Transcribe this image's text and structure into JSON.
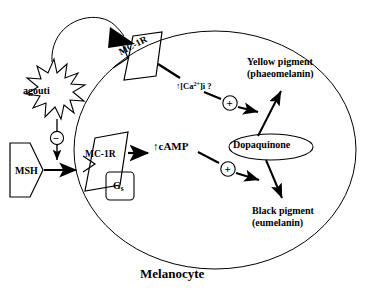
{
  "figure": {
    "caption": "Melanocyte",
    "cell_name": "Melanocyte"
  },
  "nodes": {
    "msh": {
      "label": "MSH",
      "shape": "pentagon-arrow",
      "role": "ligand"
    },
    "agouti": {
      "label": "agouti",
      "shape": "starburst",
      "role": "antagonist"
    },
    "receptor_upper": {
      "label": "MC-1R",
      "shape": "parallelogram",
      "role": "receptor"
    },
    "receptor_lower": {
      "label": "MC-1R",
      "shape": "parallelogram",
      "role": "receptor"
    },
    "g_protein": {
      "label": "G",
      "subscript": "s",
      "shape": "rounded-box",
      "role": "g-protein"
    },
    "camp": {
      "label": "cAMP",
      "arrow": "↑",
      "full": "↑cAMP",
      "role": "second-messenger"
    },
    "calcium": {
      "prefix": "↑[Ca",
      "superscript": "2+",
      "suffix": "]i ?",
      "full": "↑[Ca2+]i ?",
      "role": "second-messenger"
    },
    "dopaquinone": {
      "label": "Dopaquinone",
      "shape": "ellipse",
      "role": "precursor"
    },
    "yellow_pigment": {
      "line1": "Yellow  pigment",
      "line2": "(phaeomelanin)",
      "role": "product"
    },
    "black_pigment": {
      "line1": "Black pigment",
      "line2": "(eumelanin)",
      "role": "product"
    }
  },
  "operators": {
    "plus_upper": "+",
    "plus_lower": "+",
    "minus": "–"
  },
  "edges": [
    {
      "from": "msh",
      "to": "receptor_lower",
      "type": "activation-arrow"
    },
    {
      "from": "agouti",
      "to": "msh_receptor_link",
      "type": "inhibition",
      "symbol": "–"
    },
    {
      "from": "agouti",
      "to": "receptor_upper",
      "type": "binding-arrow-filled"
    },
    {
      "from": "receptor_lower",
      "to": "camp",
      "type": "activation-arrow"
    },
    {
      "from": "receptor_upper",
      "to": "calcium",
      "type": "activation-line"
    },
    {
      "from": "camp",
      "to": "black_pigment",
      "type": "activation-arrow",
      "symbol": "+"
    },
    {
      "from": "calcium",
      "to": "yellow_pigment",
      "type": "activation-arrow",
      "symbol": "+"
    },
    {
      "from": "dopaquinone",
      "to": "yellow_pigment",
      "type": "conversion-arrow"
    },
    {
      "from": "dopaquinone",
      "to": "black_pigment",
      "type": "conversion-arrow"
    }
  ],
  "colors": {
    "stroke": "#000000",
    "background": "#ffffff",
    "fill_arrowhead": "#000000"
  }
}
